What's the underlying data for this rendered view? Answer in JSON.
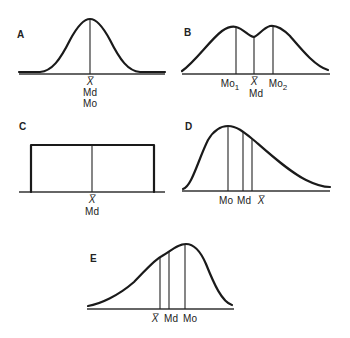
{
  "panels": {
    "A": {
      "label": "A",
      "description": "Symmetric unimodal (normal) distribution",
      "ticks": {
        "mean": "X̅",
        "median": "Md",
        "mode": "Mo"
      }
    },
    "B": {
      "label": "B",
      "description": "Symmetric bimodal distribution",
      "ticks": {
        "mode1": "Mo",
        "mode1_sub": "1",
        "mean": "X̅",
        "median": "Md",
        "mode2": "Mo",
        "mode2_sub": "2"
      }
    },
    "C": {
      "label": "C",
      "description": "Rectangular (uniform) distribution",
      "ticks": {
        "mean": "X̅",
        "median": "Md"
      }
    },
    "D": {
      "label": "D",
      "description": "Positively (right) skewed distribution",
      "ticks": {
        "mode": "Mo",
        "median": "Md",
        "mean": "X̅"
      }
    },
    "E": {
      "label": "E",
      "description": "Negatively (left) skewed distribution",
      "ticks": {
        "mean": "X̅",
        "median": "Md",
        "mode": "Mo"
      }
    }
  }
}
